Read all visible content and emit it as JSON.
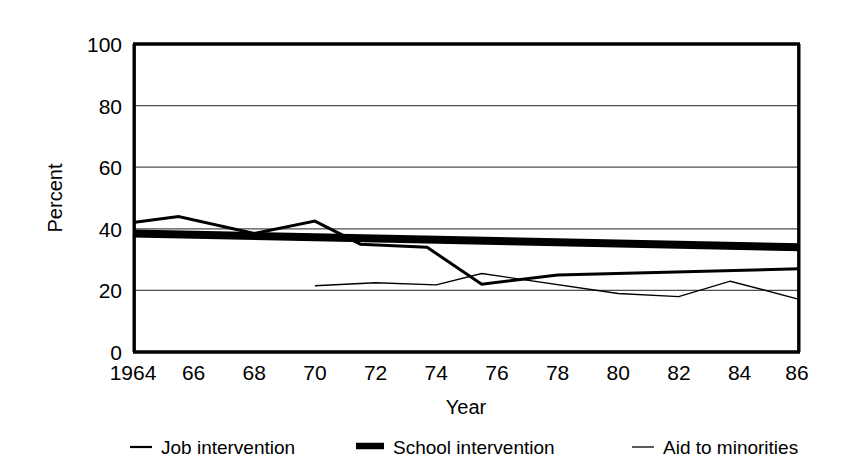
{
  "chart_data": {
    "type": "line",
    "title": "",
    "xlabel": "Year",
    "ylabel": "Percent",
    "xlim": [
      1964,
      1986
    ],
    "ylim": [
      0,
      100
    ],
    "grid": true,
    "legend_position": "bottom",
    "y_ticks": [
      "0",
      "20",
      "40",
      "60",
      "80",
      "100"
    ],
    "y_tick_values": [
      0,
      20,
      40,
      60,
      80,
      100
    ],
    "x_ticks": [
      "1964",
      "66",
      "68",
      "70",
      "72",
      "74",
      "76",
      "78",
      "80",
      "82",
      "84",
      "86"
    ],
    "x_tick_values": [
      1964,
      1966,
      1968,
      1970,
      1972,
      1974,
      1976,
      1978,
      1980,
      1982,
      1984,
      1986
    ],
    "series": [
      {
        "name": "Job intervention",
        "style": "medium-solid",
        "color": "#000000",
        "width": 3,
        "x": [
          1964,
          1965.5,
          1968,
          1970,
          1971.5,
          1973.7,
          1975.5,
          1978,
          1986
        ],
        "values": [
          42,
          44,
          38.5,
          42.5,
          35,
          34,
          22,
          25,
          27
        ]
      },
      {
        "name": "School intervention",
        "style": "thick-solid",
        "color": "#000000",
        "width": 8,
        "x": [
          1964,
          1986
        ],
        "values": [
          38.5,
          34
        ]
      },
      {
        "name": "Aid to minorities",
        "style": "thin-solid",
        "color": "#000000",
        "width": 1.4,
        "x": [
          1970,
          1972,
          1974,
          1975.5,
          1980,
          1982,
          1983.7,
          1986
        ],
        "values": [
          21.5,
          22.5,
          21.8,
          25.5,
          19,
          18,
          23,
          17
        ]
      }
    ]
  },
  "axes": {
    "y_label": "Percent",
    "x_label": "Year",
    "y_tick_labels": [
      "100",
      "80",
      "60",
      "40",
      "20",
      "0"
    ],
    "x_tick_labels": [
      "1964",
      "66",
      "68",
      "70",
      "72",
      "74",
      "76",
      "78",
      "80",
      "82",
      "84",
      "86"
    ]
  },
  "legend": {
    "items": [
      {
        "label": "Job intervention",
        "swatch": "medium-line-swatch"
      },
      {
        "label": "School intervention",
        "swatch": "thick-line-swatch"
      },
      {
        "label": "Aid to minorities",
        "swatch": "thin-line-swatch"
      }
    ]
  },
  "colors": {
    "ink": "#000000",
    "background": "#ffffff",
    "gridline": "#4d4d4d"
  }
}
